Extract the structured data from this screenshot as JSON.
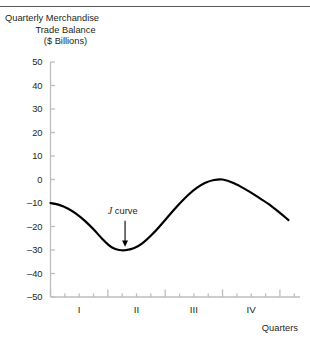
{
  "figure": {
    "top_rule_color": "#58595b",
    "background": "#ffffff"
  },
  "title": {
    "line1": "Quarterly Merchandise",
    "line2": "Trade Balance",
    "line3": "($ Billions)"
  },
  "chart_data": {
    "type": "line",
    "title": "Quarterly Merchandise Trade Balance ($ Billions)",
    "xlabel": "Quarters",
    "ylabel": "",
    "ylim": [
      -50,
      50
    ],
    "xlim": [
      0,
      4.35
    ],
    "grid": false,
    "legend": false,
    "yticks": [
      50,
      40,
      30,
      20,
      10,
      0,
      -10,
      -20,
      -30,
      -40,
      -50
    ],
    "ytick_labels": [
      "50",
      "40",
      "30",
      "20",
      "10",
      "0",
      "-10",
      "-20",
      "-30",
      "-40",
      "-50"
    ],
    "xtick_labels": [
      "I",
      "II",
      "III",
      "IV"
    ],
    "xtick_positions": [
      0.5,
      1.5,
      2.5,
      3.5
    ],
    "x_minor_ticks": [
      0.25,
      0.5,
      0.75,
      1.25,
      1.5,
      1.75,
      2.25,
      2.5,
      2.75,
      3.25,
      3.5,
      3.75,
      4.25
    ],
    "x_major_ticks": [
      0,
      1,
      2,
      3,
      4
    ],
    "axis_color": "#bcbec0",
    "line_color": "#000000",
    "line_width": 2.2,
    "series": [
      {
        "name": "Trade balance",
        "x": [
          0.0,
          0.15,
          0.3,
          0.45,
          0.6,
          0.75,
          0.9,
          1.0,
          1.1,
          1.2,
          1.3,
          1.45,
          1.6,
          1.8,
          2.0,
          2.2,
          2.4,
          2.55,
          2.7,
          2.85,
          3.0,
          3.2,
          3.4,
          3.6,
          3.8,
          4.0,
          4.15
        ],
        "y": [
          -10.0,
          -10.8,
          -12.3,
          -14.6,
          -17.6,
          -21.2,
          -25.2,
          -27.6,
          -29.3,
          -30.0,
          -30.1,
          -29.3,
          -27.2,
          -22.7,
          -17.2,
          -11.6,
          -6.6,
          -3.6,
          -1.4,
          -0.2,
          0.0,
          -1.6,
          -4.2,
          -7.2,
          -10.4,
          -14.2,
          -17.3
        ]
      }
    ],
    "annotations": [
      {
        "name": "j-curve-label",
        "text_italic": "J",
        "text_rest": "curve",
        "x": 1.3,
        "y": -14.5,
        "arrow": {
          "from_y": -17.5,
          "to_y": -28.6,
          "x": 1.3
        }
      }
    ],
    "axis_caption": "Quarters"
  }
}
